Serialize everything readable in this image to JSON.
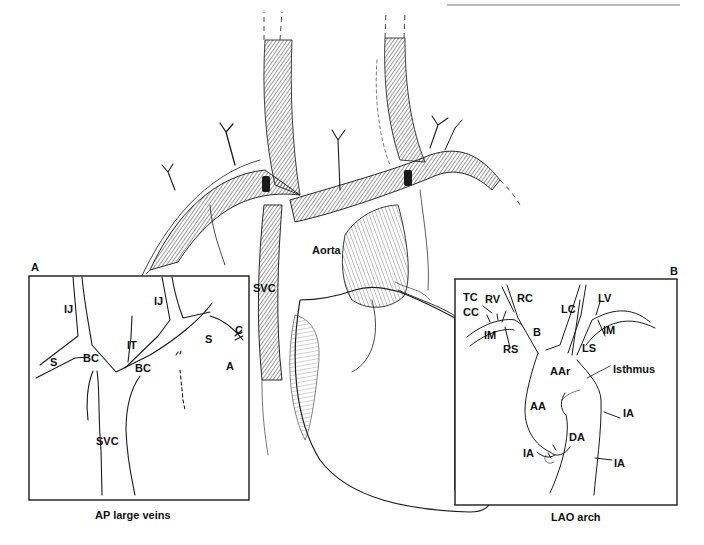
{
  "header": {
    "running_head_rule": true
  },
  "figure": {
    "main_labels": {
      "aorta": "Aorta",
      "svc": "SVC"
    },
    "panel_a": {
      "letter": "A",
      "caption": "AP large veins",
      "labels": {
        "ij_left": "IJ",
        "ij_right": "IJ",
        "it": "IT",
        "s_left": "S",
        "s_right": "S",
        "bc_left": "BC",
        "bc_right": "BC",
        "c": "C",
        "a": "A",
        "svc": "SVC"
      }
    },
    "panel_b": {
      "letter": "B",
      "caption": "LAO arch",
      "labels": {
        "tc": "TC",
        "rv": "RV",
        "rc": "RC",
        "cc": "CC",
        "im_left": "IM",
        "rs": "RS",
        "b": "B",
        "lc": "LC",
        "lv": "LV",
        "im_right": "IM",
        "ls": "LS",
        "aar": "AAr",
        "isthmus": "Isthmus",
        "aa": "AA",
        "da": "DA",
        "ia_1": "IA",
        "ia_2": "IA",
        "ia_3": "IA"
      }
    }
  }
}
